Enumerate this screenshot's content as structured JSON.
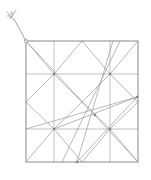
{
  "figure": {
    "background_color": "#ffffff",
    "width": 151,
    "height": 180
  },
  "annotation": {
    "label": "2,6",
    "rotation_deg": -52,
    "text_x": 12,
    "text_y": 16,
    "color": "#6e6e6e",
    "leader": {
      "from_x": 14,
      "from_y": 19,
      "to_x": 26,
      "to_y": 41
    },
    "tick_marks": [
      {
        "x1": 7,
        "y1": 12,
        "x2": 14,
        "y2": 20
      },
      {
        "x1": 16,
        "y1": 10,
        "x2": 11,
        "y2": 18
      }
    ],
    "endpoint_node": {
      "x": 26,
      "y": 41,
      "r": 1.7
    }
  },
  "frame": {
    "name": "outer-square",
    "left": 26,
    "top": 41,
    "right": 138,
    "bottom": 162,
    "stroke": "#8a8a8a",
    "stroke_width": 1
  },
  "chart_data": {
    "type": "diagram",
    "subtype": "line-segment-network",
    "coordinate_space": {
      "x": [
        0,
        151
      ],
      "y": [
        0,
        180
      ]
    },
    "stroke_color": "#9a9a9a",
    "stroke_width": 0.7,
    "frame_corners": [
      {
        "name": "top-left",
        "x": 26,
        "y": 41
      },
      {
        "name": "top-right",
        "x": 138,
        "y": 41
      },
      {
        "name": "bottom-right",
        "x": 138,
        "y": 162
      },
      {
        "name": "bottom-left",
        "x": 26,
        "y": 162
      }
    ],
    "hubs": [
      {
        "name": "hub-top-left",
        "x": 54,
        "y": 74,
        "degree": 8
      },
      {
        "name": "hub-top-right",
        "x": 110,
        "y": 74,
        "degree": 8
      },
      {
        "name": "hub-bottom-left",
        "x": 54,
        "y": 129,
        "degree": 8
      },
      {
        "name": "hub-bottom-right",
        "x": 110,
        "y": 129,
        "degree": 8
      }
    ],
    "nodes": [
      {
        "name": "node-right-edge",
        "x": 137,
        "y": 97
      },
      {
        "name": "node-mid-lower",
        "x": 95,
        "y": 115
      },
      {
        "name": "node-bottom-edge",
        "x": 77,
        "y": 162
      },
      {
        "name": "node-corner-marker",
        "x": 26,
        "y": 41
      }
    ],
    "gridlines": [
      {
        "name": "vertical-quarter-left",
        "x1": 54,
        "y1": 41,
        "x2": 54,
        "y2": 162
      },
      {
        "name": "vertical-quarter-right",
        "x1": 110,
        "y1": 41,
        "x2": 110,
        "y2": 162
      },
      {
        "name": "horizontal-quarter-top",
        "x1": 26,
        "y1": 74,
        "x2": 138,
        "y2": 74
      },
      {
        "name": "horizontal-quarter-bottom",
        "x1": 26,
        "y1": 129,
        "x2": 138,
        "y2": 129
      }
    ],
    "segments": [
      {
        "name": "diag-tl-corner-to-hub",
        "x1": 26,
        "y1": 41,
        "x2": 54,
        "y2": 74
      },
      {
        "name": "diag-main-tl-br",
        "x1": 26,
        "y1": 41,
        "x2": 138,
        "y2": 162
      },
      {
        "name": "diag-hub-tl-to-left-edge",
        "x1": 54,
        "y1": 74,
        "x2": 26,
        "y2": 102
      },
      {
        "name": "diag-hub-tl-to-top-edge",
        "x1": 54,
        "y1": 74,
        "x2": 82,
        "y2": 41
      },
      {
        "name": "diag-hub-tr-to-top-edge",
        "x1": 110,
        "y1": 74,
        "x2": 82,
        "y2": 41
      },
      {
        "name": "diag-hub-tr-to-right-edge",
        "x1": 110,
        "y1": 74,
        "x2": 138,
        "y2": 41
      },
      {
        "name": "diag-hub-tr-to-right-edge-down",
        "x1": 110,
        "y1": 74,
        "x2": 138,
        "y2": 102
      },
      {
        "name": "diag-hub-tl-to-center",
        "x1": 54,
        "y1": 74,
        "x2": 82,
        "y2": 102
      },
      {
        "name": "diag-hub-tr-to-center",
        "x1": 110,
        "y1": 74,
        "x2": 82,
        "y2": 102
      },
      {
        "name": "diag-center-to-hub-bl",
        "x1": 82,
        "y1": 102,
        "x2": 54,
        "y2": 129
      },
      {
        "name": "diag-center-to-hub-br",
        "x1": 82,
        "y1": 102,
        "x2": 110,
        "y2": 129
      },
      {
        "name": "diag-hub-bl-to-left-edge",
        "x1": 54,
        "y1": 129,
        "x2": 26,
        "y2": 102
      },
      {
        "name": "diag-hub-bl-to-bottom-edge",
        "x1": 54,
        "y1": 129,
        "x2": 82,
        "y2": 162
      },
      {
        "name": "diag-hub-bl-to-bottom-left",
        "x1": 54,
        "y1": 129,
        "x2": 26,
        "y2": 162
      },
      {
        "name": "diag-hub-br-to-bottom-edge",
        "x1": 110,
        "y1": 129,
        "x2": 82,
        "y2": 162
      },
      {
        "name": "diag-hub-br-to-right-edge",
        "x1": 110,
        "y1": 129,
        "x2": 138,
        "y2": 102
      },
      {
        "name": "diag-hub-br-to-bottom-right",
        "x1": 110,
        "y1": 129,
        "x2": 138,
        "y2": 162
      },
      {
        "name": "chord-left-edge-to-right-node",
        "x1": 26,
        "y1": 129,
        "x2": 137,
        "y2": 97
      },
      {
        "name": "chord-right-node-to-bottom-node",
        "x1": 137,
        "y1": 97,
        "x2": 77,
        "y2": 162
      },
      {
        "name": "chord-hub-tr-to-bottom-node",
        "x1": 113,
        "y1": 41,
        "x2": 77,
        "y2": 162
      },
      {
        "name": "chord-topright-long-descender",
        "x1": 120,
        "y1": 41,
        "x2": 62,
        "y2": 162
      },
      {
        "name": "chord-hub-bl-to-right-node",
        "x1": 54,
        "y1": 129,
        "x2": 137,
        "y2": 97
      }
    ]
  }
}
